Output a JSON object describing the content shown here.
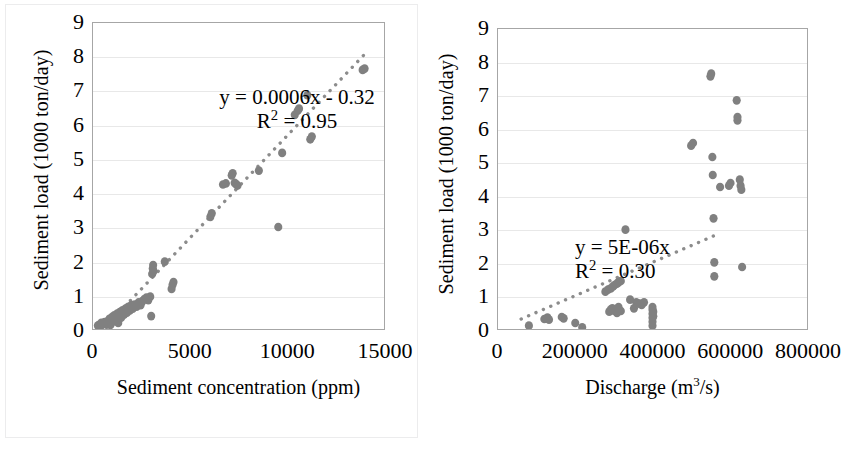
{
  "figure": {
    "marker_color": "#808080",
    "trend_color": "#8c8c8c",
    "axis_color": "#a6a6a6",
    "grid_color": "#e8e8e8",
    "background": "#ffffff"
  },
  "chart_data": [
    {
      "id": "sediment-load-vs-concentration",
      "type": "scatter",
      "title": "",
      "xlabel": "Sediment concentration (ppm)",
      "ylabel": "Sediment load (1000 ton/day)",
      "xlim": [
        0,
        15000
      ],
      "ylim": [
        0,
        9
      ],
      "xticks": [
        0,
        5000,
        10000,
        15000
      ],
      "xtick_labels": [
        "0",
        "5000",
        "10000",
        "15000"
      ],
      "yticks": [
        0,
        1,
        2,
        3,
        4,
        5,
        6,
        7,
        8,
        9
      ],
      "ytick_labels": [
        "0",
        "1",
        "2",
        "3",
        "4",
        "5",
        "6",
        "7",
        "8",
        "9"
      ],
      "grid": "horizontal",
      "legend": "none",
      "annotations": {
        "equation": "y = 0.0006x - 0.32",
        "r_squared_label": "R",
        "r_squared_sup": "2",
        "r_squared_value": " = 0.95"
      },
      "trendline": {
        "style": "dotted",
        "slope": 0.0006,
        "intercept": -0.32,
        "x_start": 500,
        "x_end": 14200
      },
      "points": [
        [
          250,
          0.1
        ],
        [
          320,
          0.12
        ],
        [
          380,
          0.08
        ],
        [
          430,
          0.18
        ],
        [
          520,
          0.15
        ],
        [
          600,
          0.2
        ],
        [
          700,
          0.13
        ],
        [
          780,
          0.24
        ],
        [
          850,
          0.3
        ],
        [
          900,
          0.12
        ],
        [
          980,
          0.35
        ],
        [
          1050,
          0.22
        ],
        [
          1100,
          0.4
        ],
        [
          1180,
          0.28
        ],
        [
          1250,
          0.45
        ],
        [
          1300,
          0.18
        ],
        [
          1380,
          0.5
        ],
        [
          1450,
          0.33
        ],
        [
          1520,
          0.55
        ],
        [
          1600,
          0.42
        ],
        [
          1680,
          0.6
        ],
        [
          1750,
          0.48
        ],
        [
          1820,
          0.65
        ],
        [
          1900,
          0.55
        ],
        [
          1980,
          0.7
        ],
        [
          2050,
          0.6
        ],
        [
          2150,
          0.72
        ],
        [
          2250,
          0.66
        ],
        [
          2350,
          0.78
        ],
        [
          2450,
          0.7
        ],
        [
          2550,
          0.82
        ],
        [
          2650,
          0.88
        ],
        [
          2750,
          0.92
        ],
        [
          2850,
          0.85
        ],
        [
          2950,
          0.95
        ],
        [
          3000,
          0.38
        ],
        [
          3050,
          1.62
        ],
        [
          3080,
          1.78
        ],
        [
          3100,
          1.88
        ],
        [
          3120,
          1.7
        ],
        [
          3700,
          1.98
        ],
        [
          4050,
          1.18
        ],
        [
          4100,
          1.3
        ],
        [
          4150,
          1.38
        ],
        [
          6050,
          3.3
        ],
        [
          6120,
          3.4
        ],
        [
          6700,
          4.25
        ],
        [
          6850,
          4.28
        ],
        [
          7150,
          4.52
        ],
        [
          7200,
          4.58
        ],
        [
          7300,
          4.3
        ],
        [
          7380,
          4.26
        ],
        [
          7450,
          4.22
        ],
        [
          8550,
          4.66
        ],
        [
          9550,
          3.0
        ],
        [
          9750,
          5.18
        ],
        [
          10400,
          6.3
        ],
        [
          10550,
          6.42
        ],
        [
          10620,
          6.48
        ],
        [
          11050,
          6.88
        ],
        [
          11200,
          5.58
        ],
        [
          11280,
          5.66
        ],
        [
          13900,
          7.62
        ],
        [
          14000,
          7.66
        ]
      ]
    },
    {
      "id": "sediment-load-vs-discharge",
      "type": "scatter",
      "title": "",
      "xlabel_prefix": "Discharge (m",
      "xlabel_sup": "3",
      "xlabel_suffix": "/s)",
      "xlabel": "Discharge (m3/s)",
      "ylabel": "Sediment load (1000 ton/day)",
      "xlim": [
        0,
        800000
      ],
      "ylim": [
        0,
        9
      ],
      "xticks": [
        0,
        200000,
        400000,
        600000,
        800000
      ],
      "xtick_labels": [
        "0",
        "200000",
        "400000",
        "600000",
        "800000"
      ],
      "yticks": [
        0,
        1,
        2,
        3,
        4,
        5,
        6,
        7,
        8,
        9
      ],
      "ytick_labels": [
        "0",
        "1",
        "2",
        "3",
        "4",
        "5",
        "6",
        "7",
        "8",
        "9"
      ],
      "grid": "horizontal",
      "legend": "none",
      "annotations": {
        "equation": "y = 5E-06x",
        "r_squared_label": "R",
        "r_squared_sup": "2",
        "r_squared_value": " = 0.30"
      },
      "trendline": {
        "style": "dotted",
        "slope": 5e-06,
        "intercept": 0.0,
        "x_start": 60000,
        "x_end": 570000
      },
      "points": [
        [
          80000,
          0.1
        ],
        [
          120000,
          0.3
        ],
        [
          128000,
          0.34
        ],
        [
          132000,
          0.28
        ],
        [
          165000,
          0.36
        ],
        [
          170000,
          0.32
        ],
        [
          200000,
          0.18
        ],
        [
          218000,
          0.05
        ],
        [
          278000,
          1.12
        ],
        [
          285000,
          1.18
        ],
        [
          292000,
          1.22
        ],
        [
          298000,
          1.28
        ],
        [
          302000,
          1.32
        ],
        [
          308000,
          1.36
        ],
        [
          312000,
          1.4
        ],
        [
          318000,
          1.44
        ],
        [
          288000,
          0.52
        ],
        [
          292000,
          0.58
        ],
        [
          296000,
          0.62
        ],
        [
          300000,
          0.55
        ],
        [
          304000,
          0.6
        ],
        [
          308000,
          0.48
        ],
        [
          312000,
          0.66
        ],
        [
          318000,
          0.54
        ],
        [
          330000,
          2.98
        ],
        [
          342000,
          0.88
        ],
        [
          358000,
          0.8
        ],
        [
          366000,
          0.76
        ],
        [
          372000,
          0.72
        ],
        [
          378000,
          0.8
        ],
        [
          352000,
          0.62
        ],
        [
          400000,
          0.1
        ],
        [
          400000,
          0.22
        ],
        [
          400000,
          0.34
        ],
        [
          400000,
          0.46
        ],
        [
          400000,
          0.58
        ],
        [
          400000,
          0.66
        ],
        [
          402000,
          0.52
        ],
        [
          402000,
          0.38
        ],
        [
          500000,
          5.5
        ],
        [
          505000,
          5.58
        ],
        [
          550000,
          7.58
        ],
        [
          552000,
          7.66
        ],
        [
          555000,
          5.16
        ],
        [
          556000,
          4.62
        ],
        [
          558000,
          3.32
        ],
        [
          560000,
          2.0
        ],
        [
          560000,
          1.58
        ],
        [
          575000,
          4.26
        ],
        [
          598000,
          4.3
        ],
        [
          602000,
          4.38
        ],
        [
          618000,
          6.86
        ],
        [
          620000,
          6.36
        ],
        [
          620000,
          6.26
        ],
        [
          626000,
          4.48
        ],
        [
          628000,
          4.3
        ],
        [
          630000,
          4.18
        ],
        [
          632000,
          1.86
        ]
      ]
    }
  ]
}
